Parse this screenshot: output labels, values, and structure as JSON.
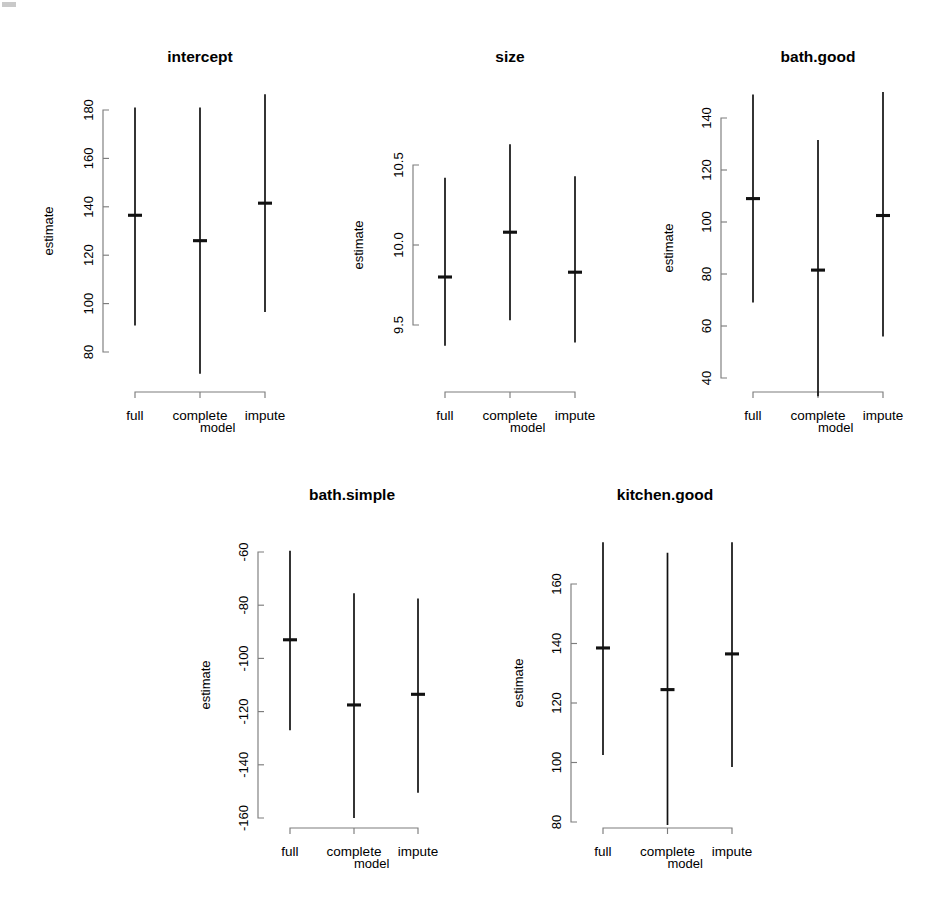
{
  "figure": {
    "width": 936,
    "height": 915,
    "background": "#ffffff",
    "line_color": "#111111",
    "axis_color": "#7d7d7d",
    "shared_x_categories": [
      "full",
      "complete",
      "impute"
    ],
    "shared_x_label": "model",
    "shared_y_label": "estimate",
    "panel_titles": [
      "intercept",
      "size",
      "bath.good",
      "bath.simple",
      "kitchen.good"
    ]
  },
  "labels": {
    "estimate": "estimate",
    "model": "model",
    "full": "full",
    "complete": "complete",
    "impute": "impute"
  },
  "chart_data": [
    {
      "type": "scatter",
      "title": "intercept",
      "xlabel": "model",
      "ylabel": "estimate",
      "categories": [
        "full",
        "complete",
        "impute"
      ],
      "values": [
        136.5,
        126.0,
        141.5
      ],
      "lower": [
        91.0,
        71.0,
        96.5
      ],
      "upper": [
        181.0,
        181.0,
        186.5
      ],
      "yticks": [
        80,
        100,
        120,
        140,
        160,
        180
      ],
      "ytick_labels": [
        "80",
        "100",
        "120",
        "140",
        "160",
        "180"
      ],
      "ylim": [
        71,
        187
      ],
      "grid": false,
      "legend": "none",
      "error_bar_style": "vertical-line-with-center-tick"
    },
    {
      "type": "scatter",
      "title": "size",
      "xlabel": "model",
      "ylabel": "estimate",
      "categories": [
        "full",
        "complete",
        "impute"
      ],
      "values": [
        9.8,
        10.08,
        9.83
      ],
      "lower": [
        9.37,
        9.53,
        9.39
      ],
      "upper": [
        10.42,
        10.63,
        10.43
      ],
      "yticks": [
        9.5,
        10.0,
        10.5
      ],
      "ytick_labels": [
        "9.5",
        "10.0",
        "10.5"
      ],
      "ylim": [
        9.37,
        10.63
      ],
      "grid": false,
      "legend": "none",
      "error_bar_style": "vertical-line-with-center-tick"
    },
    {
      "type": "scatter",
      "title": "bath.good",
      "xlabel": "model",
      "ylabel": "estimate",
      "categories": [
        "full",
        "complete",
        "impute"
      ],
      "values": [
        109.0,
        81.5,
        102.5
      ],
      "lower": [
        69.0,
        33.0,
        56.0
      ],
      "upper": [
        149.0,
        131.5,
        150.0
      ],
      "yticks": [
        40,
        60,
        80,
        100,
        120,
        140
      ],
      "ytick_labels": [
        "40",
        "60",
        "80",
        "100",
        "120",
        "140"
      ],
      "ylim": [
        33,
        150
      ],
      "grid": false,
      "legend": "none",
      "error_bar_style": "vertical-line-with-center-tick"
    },
    {
      "type": "scatter",
      "title": "bath.simple",
      "xlabel": "model",
      "ylabel": "estimate",
      "categories": [
        "full",
        "complete",
        "impute"
      ],
      "values": [
        -93.0,
        -117.5,
        -113.5
      ],
      "lower": [
        -127.0,
        -160.0,
        -150.5
      ],
      "upper": [
        -59.5,
        -75.5,
        -77.5
      ],
      "yticks": [
        -160,
        -140,
        -120,
        -100,
        -80,
        -60
      ],
      "ytick_labels": [
        "-160",
        "-140",
        "-120",
        "-100",
        "-80",
        "-60"
      ],
      "ylim": [
        -160,
        -59.5
      ],
      "grid": false,
      "legend": "none",
      "error_bar_style": "vertical-line-with-center-tick"
    },
    {
      "type": "scatter",
      "title": "kitchen.good",
      "xlabel": "model",
      "ylabel": "estimate",
      "categories": [
        "full",
        "complete",
        "impute"
      ],
      "values": [
        138.5,
        124.5,
        136.5
      ],
      "lower": [
        102.5,
        79.0,
        98.5
      ],
      "upper": [
        174.0,
        170.5,
        174.0
      ],
      "yticks": [
        80,
        100,
        120,
        140,
        160
      ],
      "ytick_labels": [
        "80",
        "100",
        "120",
        "140",
        "160"
      ],
      "ylim": [
        79,
        174
      ],
      "grid": false,
      "legend": "none",
      "error_bar_style": "vertical-line-with-center-tick"
    }
  ],
  "panel_geometry": [
    {
      "plot_x0": 135,
      "plot_x1": 265,
      "axis_x": 103,
      "y_top": 110,
      "y_bottom": 352,
      "v_top": 108,
      "v_bottom": 388,
      "title_x": 200,
      "title_y": 62,
      "xaxis_y": 392,
      "xlabel_y": 432,
      "xtick_y": 414,
      "ylabel_x": 48,
      "ylabel_y": 231,
      "tick_label_x": 88
    },
    {
      "plot_x0": 445,
      "plot_x1": 575,
      "axis_x": 413,
      "y_top": 165,
      "y_bottom": 325,
      "v_top": 148,
      "v_bottom": 382,
      "title_x": 510,
      "title_y": 62,
      "xaxis_y": 392,
      "xlabel_y": 432,
      "xtick_y": 414,
      "ylabel_x": 358,
      "ylabel_y": 245,
      "tick_label_x": 398
    },
    {
      "plot_x0": 753,
      "plot_x1": 883,
      "axis_x": 721,
      "y_top": 118,
      "y_bottom": 378,
      "v_top": 95,
      "v_bottom": 378,
      "title_x": 818,
      "title_y": 62,
      "xaxis_y": 392,
      "xlabel_y": 432,
      "xtick_y": 414,
      "ylabel_x": 668,
      "ylabel_y": 248,
      "tick_label_x": 706
    },
    {
      "plot_x0": 290,
      "plot_x1": 418,
      "axis_x": 258,
      "y_top": 552,
      "y_bottom": 818,
      "v_top": 542,
      "v_bottom": 818,
      "title_x": 352,
      "title_y": 500,
      "xaxis_y": 828,
      "xlabel_y": 868,
      "xtick_y": 850,
      "ylabel_x": 205,
      "ylabel_y": 685,
      "tick_label_x": 243
    },
    {
      "plot_x0": 603,
      "plot_x1": 732,
      "axis_x": 571,
      "y_top": 584,
      "y_bottom": 822,
      "v_top": 540,
      "v_bottom": 822,
      "title_x": 665,
      "title_y": 500,
      "xaxis_y": 828,
      "xlabel_y": 868,
      "xtick_y": 850,
      "ylabel_x": 518,
      "ylabel_y": 683,
      "tick_label_x": 556
    }
  ]
}
